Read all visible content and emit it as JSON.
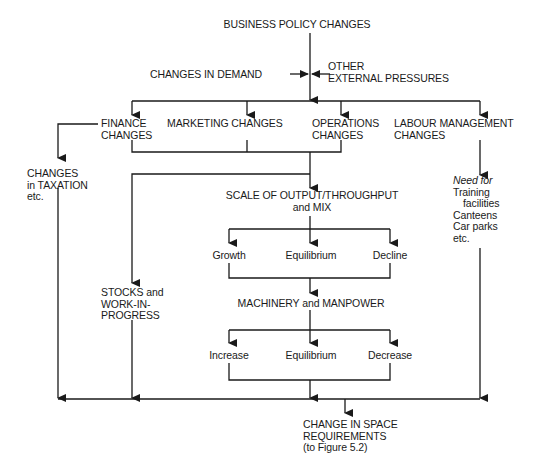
{
  "diagram": {
    "title": "BUSINESS POLICY CHANGES",
    "inputs": {
      "demand": "CHANGES IN DEMAND",
      "external_line1": "OTHER",
      "external_line2": "EXTERNAL PRESSURES"
    },
    "branches": {
      "finance": [
        "FINANCE",
        "CHANGES"
      ],
      "marketing": "MARKETING CHANGES",
      "operations": [
        "OPERATIONS",
        "CHANGES"
      ],
      "labour": [
        "LABOUR MANAGEMENT",
        "CHANGES"
      ]
    },
    "taxation": [
      "CHANGES",
      "in TAXATION",
      "etc."
    ],
    "labour_needs": {
      "heading": "Need for",
      "items": [
        "Training",
        "facilities",
        "Canteens",
        "Car parks",
        "etc."
      ]
    },
    "scale": [
      "SCALE OF OUTPUT/THROUGHPUT",
      "and MIX"
    ],
    "scale_options": [
      "Growth",
      "Equilibrium",
      "Decline"
    ],
    "stocks": [
      "STOCKS and",
      "WORK-IN-",
      "PROGRESS"
    ],
    "machinery": "MACHINERY and MANPOWER",
    "machinery_options": [
      "Increase",
      "Equilibrium",
      "Decrease"
    ],
    "result": [
      "CHANGE IN SPACE",
      "REQUIREMENTS",
      "(to Figure 5.2)"
    ]
  }
}
